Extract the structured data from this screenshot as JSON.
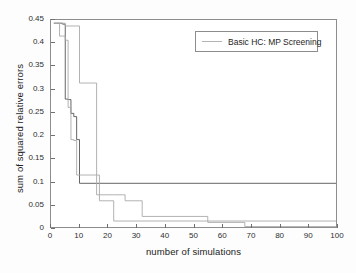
{
  "chart_data": {
    "type": "line",
    "title": "",
    "xlabel": "number of simulations",
    "ylabel": "sum of squared relative errors",
    "xlim": [
      0,
      100
    ],
    "ylim": [
      0,
      0.45
    ],
    "grid": false,
    "xticks": [
      0,
      10,
      20,
      30,
      40,
      50,
      60,
      70,
      80,
      90,
      100
    ],
    "yticks": [
      0,
      0.05,
      0.1,
      0.15,
      0.2,
      0.25,
      0.3,
      0.35,
      0.4,
      0.45
    ],
    "xtick_labels": [
      "0",
      "10",
      "20",
      "30",
      "40",
      "50",
      "60",
      "70",
      "80",
      "90",
      "100"
    ],
    "ytick_labels": [
      "0",
      "0.05",
      "0.1",
      "0.15",
      "0.2",
      "0.25",
      "0.3",
      "0.35",
      "0.4",
      "0.45"
    ],
    "legend": {
      "position": "top-right",
      "entries": [
        {
          "label": "Basic HC: MP Screening",
          "color": "#b4b4b4"
        }
      ]
    },
    "step_style": "post",
    "series": [
      {
        "name": "run-1",
        "color": "#555555",
        "x": [
          1,
          2,
          4,
          5,
          6,
          7,
          8,
          9,
          10,
          100
        ],
        "y": [
          0.443,
          0.443,
          0.441,
          0.278,
          0.277,
          0.247,
          0.24,
          0.19,
          0.095,
          0.095
        ]
      },
      {
        "name": "run-2",
        "color": "#a9a9a9",
        "x": [
          1,
          3,
          4,
          5,
          6,
          7,
          8,
          9,
          15,
          16,
          17,
          21,
          22,
          100
        ],
        "y": [
          0.443,
          0.415,
          0.415,
          0.406,
          0.26,
          0.19,
          0.188,
          0.113,
          0.113,
          0.07,
          0.057,
          0.057,
          0.013,
          0.013
        ]
      },
      {
        "name": "run-3",
        "color": "#a9a9a9",
        "x": [
          1,
          4,
          5,
          9,
          10,
          14,
          15,
          16,
          17,
          22,
          25,
          26,
          31,
          32,
          54,
          55,
          67,
          68,
          100
        ],
        "y": [
          0.443,
          0.443,
          0.437,
          0.437,
          0.313,
          0.313,
          0.313,
          0.113,
          0.07,
          0.07,
          0.07,
          0.057,
          0.057,
          0.023,
          0.023,
          0.01,
          0.01,
          0.001,
          0.001
        ]
      }
    ]
  },
  "axes": {
    "x_title": "number of simulations",
    "y_title": "sum of squared relative errors"
  },
  "legend": {
    "label": "Basic HC: MP Screening"
  }
}
